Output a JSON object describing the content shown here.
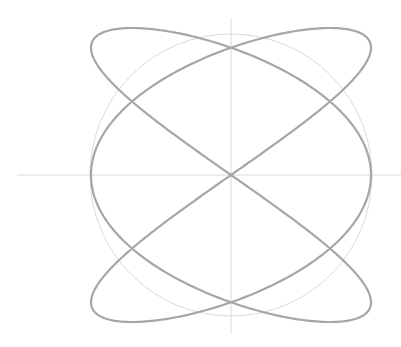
{
  "diagram": {
    "type": "lissajous-figure",
    "canvas": {
      "width": 401,
      "height": 347
    },
    "center": {
      "x": 231,
      "y": 175
    },
    "axes": {
      "horizontal": {
        "x1": 17,
        "x2": 401,
        "y": 175,
        "color": "#d9d9d9",
        "width": 1
      },
      "vertical": {
        "x": 231,
        "y1": 19,
        "y2": 333,
        "color": "#d9d9d9",
        "width": 1
      }
    },
    "circle": {
      "radius": 141,
      "color": "#dadada",
      "width": 1
    },
    "curve": {
      "equation": "x = A·cos(3t), y = B·sin(2t)",
      "freq_x": 3,
      "freq_y": 2,
      "amplitude_x": 140,
      "amplitude_y": 147,
      "color": "#a6a6a6",
      "width": 2.2,
      "samples": 720
    }
  }
}
